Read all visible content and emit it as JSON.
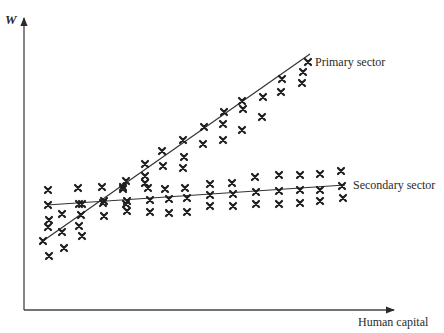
{
  "chart_data": {
    "type": "scatter",
    "title": "",
    "xlabel": "Human capital",
    "ylabel": "W",
    "grid": false,
    "legend": "inline labels at line ends",
    "axes": {
      "origin_px": [
        24,
        310
      ],
      "y_top_px": 18,
      "x_right_px": 392
    },
    "series": [
      {
        "name": "Primary sector",
        "line": {
          "from_px": [
            40,
            243
          ],
          "to_px": [
            310,
            54
          ]
        },
        "points_px": [
          [
            49,
            256
          ],
          [
            64,
            248
          ],
          [
            43,
            241
          ],
          [
            62,
            232
          ],
          [
            82,
            236
          ],
          [
            49,
            220
          ],
          [
            81,
            215
          ],
          [
            104,
            216
          ],
          [
            62,
            214
          ],
          [
            104,
            201
          ],
          [
            126,
            204
          ],
          [
            82,
            204
          ],
          [
            123,
            189
          ],
          [
            126,
            181
          ],
          [
            145,
            183
          ],
          [
            145,
            176
          ],
          [
            163,
            166
          ],
          [
            183,
            168
          ],
          [
            145,
            164
          ],
          [
            162,
            151
          ],
          [
            184,
            157
          ],
          [
            183,
            140
          ],
          [
            203,
            144
          ],
          [
            223,
            140
          ],
          [
            204,
            127
          ],
          [
            223,
            124
          ],
          [
            242,
            130
          ],
          [
            224,
            112
          ],
          [
            243,
            109
          ],
          [
            262,
            117
          ],
          [
            242,
            101
          ],
          [
            263,
            97
          ],
          [
            281,
            92
          ],
          [
            282,
            79
          ],
          [
            302,
            83
          ],
          [
            303,
            72
          ],
          [
            308,
            62
          ]
        ]
      },
      {
        "name": "Secondary sector",
        "line": {
          "from_px": [
            47,
            205
          ],
          "to_px": [
            345,
            185
          ]
        },
        "points_px": [
          [
            48,
            190
          ],
          [
            78,
            188
          ],
          [
            102,
            187
          ],
          [
            123,
            187
          ],
          [
            148,
            188
          ],
          [
            165,
            189
          ],
          [
            185,
            188
          ],
          [
            210,
            184
          ],
          [
            232,
            183
          ],
          [
            255,
            177
          ],
          [
            279,
            175
          ],
          [
            300,
            175
          ],
          [
            320,
            174
          ],
          [
            341,
            171
          ],
          [
            48,
            205
          ],
          [
            79,
            204
          ],
          [
            103,
            203
          ],
          [
            127,
            201
          ],
          [
            150,
            200
          ],
          [
            169,
            199
          ],
          [
            187,
            198
          ],
          [
            210,
            195
          ],
          [
            233,
            194
          ],
          [
            256,
            192
          ],
          [
            279,
            191
          ],
          [
            300,
            190
          ],
          [
            320,
            190
          ],
          [
            342,
            186
          ],
          [
            48,
            227
          ],
          [
            79,
            226
          ],
          [
            127,
            211
          ],
          [
            150,
            212
          ],
          [
            169,
            213
          ],
          [
            187,
            212
          ],
          [
            210,
            206
          ],
          [
            233,
            206
          ],
          [
            256,
            204
          ],
          [
            279,
            204
          ],
          [
            300,
            203
          ],
          [
            320,
            201
          ],
          [
            343,
            198
          ]
        ]
      }
    ]
  },
  "labels": {
    "y_axis": "W",
    "x_axis": "Human capital",
    "primary": "Primary sector",
    "secondary": "Secondary sector"
  }
}
